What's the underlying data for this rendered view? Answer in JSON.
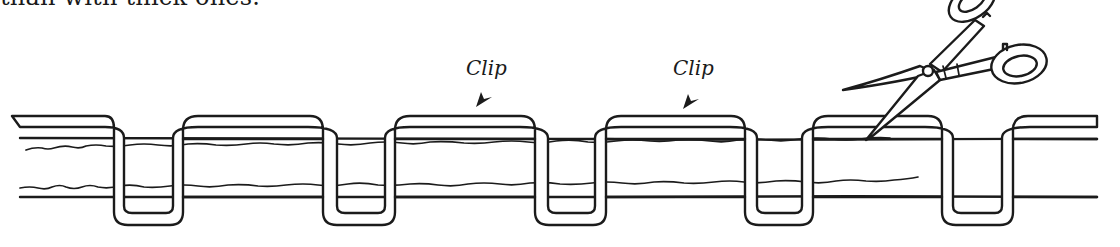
{
  "caption": {
    "text": "than with thick ones."
  },
  "labels": [
    {
      "text": "Clip",
      "x": 466,
      "y": 56
    },
    {
      "text": "Clip",
      "x": 673,
      "y": 56
    }
  ],
  "diagram": {
    "elements": [
      "fabric-band",
      "stitch-thread",
      "clip-arrow",
      "clip-arrow",
      "scissors-icon"
    ],
    "colors": {
      "ink": "#1b1b1b",
      "background": "#ffffff"
    }
  }
}
